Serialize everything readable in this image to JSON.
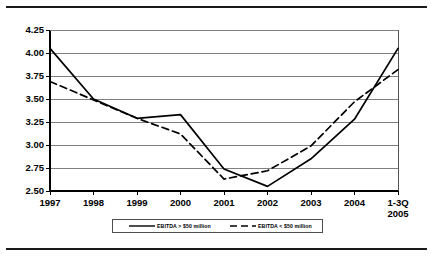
{
  "chart_data": {
    "type": "line",
    "title": "",
    "xlabel": "",
    "ylabel": "",
    "categories": [
      "1997",
      "1998",
      "1999",
      "2000",
      "2001",
      "2002",
      "2003",
      "2004",
      "1-3Q 2005"
    ],
    "x_tick_labels": [
      {
        "line1": "1997",
        "line2": ""
      },
      {
        "line1": "1998",
        "line2": ""
      },
      {
        "line1": "1999",
        "line2": ""
      },
      {
        "line1": "2000",
        "line2": ""
      },
      {
        "line1": "2001",
        "line2": ""
      },
      {
        "line1": "2002",
        "line2": ""
      },
      {
        "line1": "2003",
        "line2": ""
      },
      {
        "line1": "2004",
        "line2": ""
      },
      {
        "line1": "1-3Q",
        "line2": "2005"
      }
    ],
    "ylim": [
      2.5,
      4.25
    ],
    "y_tick_labels": [
      "2.50",
      "2.75",
      "3.00",
      "3.25",
      "3.50",
      "3.75",
      "4.00",
      "4.25"
    ],
    "y_tick_values": [
      2.5,
      2.75,
      3.0,
      3.25,
      3.5,
      3.75,
      4.0,
      4.25
    ],
    "grid": true,
    "grid_axis": "y",
    "legend_position": "bottom",
    "series": [
      {
        "name": "EBITDA > $50 million",
        "style": "solid",
        "color": "#000000",
        "values": [
          4.05,
          3.5,
          3.29,
          3.33,
          2.74,
          2.55,
          2.85,
          3.28,
          4.05
        ]
      },
      {
        "name": "EBITDA < $50 million",
        "style": "dashed",
        "color": "#000000",
        "values": [
          3.69,
          3.49,
          3.29,
          3.12,
          2.63,
          2.72,
          2.99,
          3.47,
          3.82
        ]
      }
    ]
  },
  "figure": {
    "frame_color": "#555555",
    "grid_color": "#808080",
    "axis_color": "#000000",
    "rule_color": "#1a1a1a",
    "background": "#ffffff"
  }
}
